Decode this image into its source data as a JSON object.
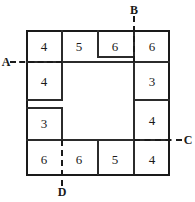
{
  "figure": {
    "width": 195,
    "height": 202,
    "background": "#ffffff",
    "ink_color": "#1a1a1a"
  },
  "cells": [
    {
      "id": "top-1",
      "value": "4",
      "cx": 44,
      "cy": 46
    },
    {
      "id": "top-2",
      "value": "5",
      "cx": 79,
      "cy": 46
    },
    {
      "id": "top-3",
      "value": "6",
      "cx": 115,
      "cy": 46
    },
    {
      "id": "top-4",
      "value": "6",
      "cx": 152,
      "cy": 46
    },
    {
      "id": "left-2",
      "value": "4",
      "cx": 44,
      "cy": 81
    },
    {
      "id": "right-2",
      "value": "3",
      "cx": 152,
      "cy": 81
    },
    {
      "id": "left-3",
      "value": "3",
      "cx": 44,
      "cy": 123
    },
    {
      "id": "right-3",
      "value": "4",
      "cx": 152,
      "cy": 120
    },
    {
      "id": "bottom-1",
      "value": "6",
      "cx": 44,
      "cy": 159
    },
    {
      "id": "bottom-2",
      "value": "6",
      "cx": 79,
      "cy": 159
    },
    {
      "id": "bottom-3",
      "value": "5",
      "cx": 115,
      "cy": 159
    },
    {
      "id": "bottom-4",
      "value": "4",
      "cx": 152,
      "cy": 159
    }
  ],
  "markers": [
    {
      "id": "A",
      "label": "A",
      "cx": 6,
      "cy": 62,
      "side": "left"
    },
    {
      "id": "B",
      "label": "B",
      "cx": 134,
      "cy": 10,
      "side": "top"
    },
    {
      "id": "C",
      "label": "C",
      "cx": 188,
      "cy": 140,
      "side": "right"
    },
    {
      "id": "D",
      "label": "D",
      "cx": 62,
      "cy": 192,
      "side": "bottom"
    }
  ],
  "cut_lines": [
    {
      "id": "cut-A",
      "orientation": "horizontal",
      "from": 10,
      "to": 62,
      "at": 62,
      "label": "A"
    },
    {
      "id": "cut-B",
      "orientation": "vertical",
      "from": 16,
      "to": 62,
      "at": 134,
      "label": "B"
    },
    {
      "id": "cut-C",
      "orientation": "horizontal",
      "from": 134,
      "to": 182,
      "at": 140,
      "label": "C"
    },
    {
      "id": "cut-D",
      "orientation": "vertical",
      "from": 140,
      "to": 186,
      "at": 62,
      "label": "D"
    }
  ],
  "totals": {
    "top_row_sum": "21",
    "bottom_row_sum": "21",
    "left_column_sum": "17",
    "right_column_sum": "17"
  }
}
